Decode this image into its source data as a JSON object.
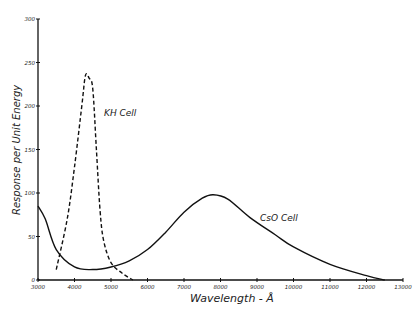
{
  "chart_data": {
    "type": "line",
    "title": "",
    "xlabel": "Wavelength - Å",
    "ylabel": "Response per Unit Energy",
    "xlim": [
      3000,
      13000
    ],
    "ylim": [
      0,
      300
    ],
    "xticks": [
      3000,
      4000,
      5000,
      6000,
      7000,
      8000,
      9000,
      10000,
      11000,
      12000,
      13000
    ],
    "yticks": [
      0,
      50,
      100,
      150,
      200,
      250,
      300
    ],
    "grid": false,
    "legend": "inline labels",
    "series": [
      {
        "name": "KH Cell",
        "style": "dashed",
        "x": [
          3500,
          3800,
          4000,
          4200,
          4300,
          4400,
          4500,
          4600,
          4700,
          4800,
          5000,
          5300,
          5600
        ],
        "y": [
          12,
          70,
          130,
          200,
          235,
          232,
          220,
          150,
          80,
          45,
          20,
          8,
          0
        ]
      },
      {
        "name": "CsO Cell",
        "style": "solid",
        "x": [
          3000,
          3200,
          3500,
          4000,
          4500,
          5000,
          5500,
          6000,
          6500,
          7000,
          7500,
          7800,
          8200,
          8800,
          9500,
          10000,
          11000,
          12000,
          12500
        ],
        "y": [
          85,
          70,
          35,
          15,
          12,
          15,
          22,
          35,
          55,
          78,
          94,
          98,
          93,
          72,
          52,
          38,
          18,
          5,
          0
        ]
      }
    ]
  },
  "labels": {
    "xlabel": "Wavelength - Å",
    "ylabel": "Response per Unit Energy",
    "kh_label": "KH Cell",
    "cso_label": "CsO Cell"
  }
}
